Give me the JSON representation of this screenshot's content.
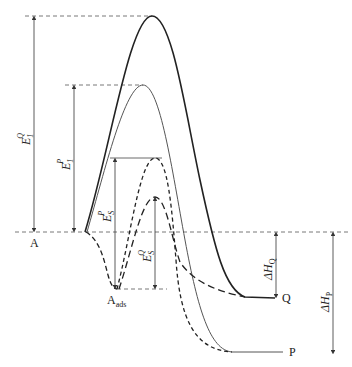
{
  "diagram": {
    "type": "reaction-energy-profile",
    "labels": {
      "reactant": "A",
      "adsorbed": "A",
      "adsorbed_sub": "ads",
      "product_q": "Q",
      "product_p": "P",
      "e1q_main": "E",
      "e1q_sub": "1",
      "e1q_sup": "Q",
      "e1p_main": "E",
      "e1p_sub": "1",
      "e1p_sup": "P",
      "esp_main": "E",
      "esp_sub": "S",
      "esp_sup": "P",
      "esq_main": "E",
      "esq_sub": "S",
      "esq_sup": "Q",
      "dhq_main": "ΔH",
      "dhq_sub": "Q",
      "dhp_main": "ΔH",
      "dhp_sub": "P"
    },
    "curves": [
      {
        "name": "uncatalyzed path to Q",
        "style": "solid-thick",
        "peak": "E1^Q",
        "end": "Q"
      },
      {
        "name": "uncatalyzed path to P",
        "style": "solid-thin",
        "peak": "E1^P",
        "end": "P"
      },
      {
        "name": "surface path to P",
        "style": "dashed",
        "via": "A_ads",
        "peak": "ES^P",
        "end": "P"
      },
      {
        "name": "surface path to Q",
        "style": "dashed-long",
        "via": "A_ads",
        "peak": "ES^Q",
        "end": "Q"
      }
    ],
    "colors": {
      "line": "#222222",
      "thin_line": "#555555"
    }
  }
}
